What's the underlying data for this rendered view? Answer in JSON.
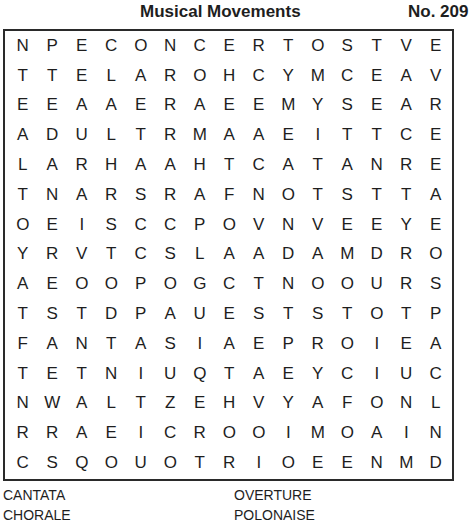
{
  "header": {
    "title": "Musical Movements",
    "puzzle_number": "No. 209"
  },
  "grid": {
    "rows": 15,
    "cols": 15,
    "letters": [
      [
        "N",
        "P",
        "E",
        "C",
        "O",
        "N",
        "C",
        "E",
        "R",
        "T",
        "O",
        "S",
        "T",
        "V",
        "E"
      ],
      [
        "T",
        "T",
        "E",
        "L",
        "A",
        "R",
        "O",
        "H",
        "C",
        "Y",
        "M",
        "C",
        "E",
        "A",
        "V"
      ],
      [
        "E",
        "E",
        "A",
        "A",
        "E",
        "R",
        "A",
        "E",
        "E",
        "M",
        "Y",
        "S",
        "E",
        "A",
        "R"
      ],
      [
        "A",
        "D",
        "U",
        "L",
        "T",
        "R",
        "M",
        "A",
        "A",
        "E",
        "I",
        "T",
        "T",
        "C",
        "E"
      ],
      [
        "L",
        "A",
        "R",
        "H",
        "A",
        "A",
        "H",
        "T",
        "C",
        "A",
        "T",
        "A",
        "N",
        "R",
        "E"
      ],
      [
        "T",
        "N",
        "A",
        "R",
        "S",
        "R",
        "A",
        "F",
        "N",
        "O",
        "T",
        "S",
        "T",
        "T",
        "A"
      ],
      [
        "O",
        "E",
        "I",
        "S",
        "C",
        "C",
        "P",
        "O",
        "V",
        "N",
        "V",
        "E",
        "E",
        "Y",
        "E"
      ],
      [
        "Y",
        "R",
        "V",
        "T",
        "C",
        "S",
        "L",
        "A",
        "A",
        "D",
        "A",
        "M",
        "D",
        "R",
        "O"
      ],
      [
        "A",
        "E",
        "O",
        "O",
        "P",
        "O",
        "G",
        "C",
        "T",
        "N",
        "O",
        "O",
        "U",
        "R",
        "S"
      ],
      [
        "T",
        "S",
        "T",
        "D",
        "P",
        "A",
        "U",
        "E",
        "S",
        "T",
        "S",
        "T",
        "O",
        "T",
        "P"
      ],
      [
        "F",
        "A",
        "N",
        "T",
        "A",
        "S",
        "I",
        "A",
        "E",
        "P",
        "R",
        "O",
        "I",
        "E",
        "A"
      ],
      [
        "T",
        "E",
        "T",
        "N",
        "I",
        "U",
        "Q",
        "T",
        "A",
        "E",
        "Y",
        "C",
        "I",
        "U",
        "C"
      ],
      [
        "N",
        "W",
        "A",
        "L",
        "T",
        "Z",
        "E",
        "H",
        "V",
        "Y",
        "A",
        "F",
        "O",
        "N",
        "L"
      ],
      [
        "R",
        "R",
        "A",
        "E",
        "I",
        "C",
        "R",
        "O",
        "O",
        "I",
        "M",
        "O",
        "A",
        "I",
        "N"
      ],
      [
        "C",
        "S",
        "Q",
        "O",
        "U",
        "O",
        "T",
        "R",
        "I",
        "O",
        "E",
        "E",
        "N",
        "M",
        "D"
      ]
    ]
  },
  "word_list": {
    "words": [
      "CANTATA",
      "OVERTURE",
      "CHORALE",
      "POLONAISE"
    ]
  },
  "colors": {
    "text": "#1e1e1e",
    "border": "#2a2a2a",
    "background": "#ffffff"
  }
}
